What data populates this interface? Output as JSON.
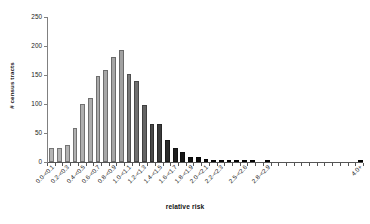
{
  "chart_data": {
    "type": "bar",
    "title": "",
    "xlabel": "relative risk",
    "ylabel": "# census tracts",
    "ylim": [
      0,
      250
    ],
    "yticks": [
      0,
      50,
      100,
      150,
      200,
      250
    ],
    "grid": false,
    "legend": "none",
    "categories": [
      "0.0-<0.1",
      "0.1-<0.2",
      "0.2-<0.3",
      "0.3-<0.4",
      "0.4-<0.5",
      "0.5-<0.6",
      "0.6-<0.7",
      "0.7-<0.8",
      "0.8-<0.9",
      "0.9-<1.0",
      "1.0-<1.1",
      "1.1-<1.2",
      "1.2-<1.3",
      "1.3-<1.4",
      "1.4-<1.5",
      "1.5-<1.6",
      "1.6-<1.7",
      "1.7-<1.8",
      "1.8-<1.9",
      "1.9-<2.0",
      "2.0-<2.1",
      "2.1-<2.2",
      "2.2-<2.3",
      "2.3-<2.4",
      "2.4-<2.5",
      "2.5-<2.6",
      "2.6-<2.7",
      "2.7-<2.8",
      "2.8-<2.9",
      "2.9-<3.0",
      "3.0-<3.1",
      "3.1-<3.2",
      "3.2-<3.3",
      "3.3-<3.4",
      "3.4-<3.5",
      "3.5-<3.6",
      "3.6-<3.7",
      "3.7-<3.8",
      "3.8-<3.9",
      "3.9-<4.0",
      "4.0+"
    ],
    "tick_labels_shown": [
      "0.0-<0.1",
      "0.2-<0.3",
      "0.4-<0.5",
      "0.6-<0.7",
      "0.8-<0.9",
      "1.0-<1.1",
      "1.2-<1.3",
      "1.4-<1.5",
      "1.6-<1.7",
      "1.8-<1.9",
      "2.0-<2.1",
      "2.2-<2.3",
      "2.5-<2.6",
      "2.8-<2.9",
      "4.0+"
    ],
    "values": [
      24,
      24,
      29,
      58,
      100,
      110,
      149,
      159,
      181,
      193,
      152,
      139,
      98,
      66,
      65,
      38,
      24,
      18,
      8,
      8,
      6,
      2,
      2,
      1,
      1,
      1,
      1,
      0,
      1,
      0,
      0,
      0,
      0,
      0,
      0,
      0,
      0,
      0,
      0,
      0,
      4
    ],
    "bar_colors": [
      "#b4b4b4",
      "#b4b4b4",
      "#b2b2b2",
      "#b0b0b0",
      "#aeaeae",
      "#acacac",
      "#a9a9a9",
      "#a7a7a7",
      "#a4a4a4",
      "#a1a1a1",
      "#7a7a7a",
      "#6f6f6f",
      "#636363",
      "#4a4a4a",
      "#3c3c3c",
      "#2b2b2b",
      "#1f1f1f",
      "#161616",
      "#101010",
      "#0d0d0d",
      "#0a0a0a",
      "#080808",
      "#080808",
      "#060606",
      "#060606",
      "#060606",
      "#060606",
      "#050505",
      "#050505",
      "#050505",
      "#050505",
      "#050505",
      "#050505",
      "#050505",
      "#050505",
      "#050505",
      "#050505",
      "#050505",
      "#050505",
      "#050505",
      "#050505"
    ]
  },
  "axes": {
    "y_axis_title": "# census tracts",
    "x_axis_title": "relative risk"
  }
}
